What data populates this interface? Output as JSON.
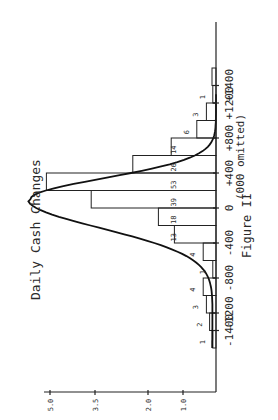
{
  "chart_data": {
    "type": "bar",
    "title": "Daily Cash Changes",
    "caption": "Figure II",
    "xlabel": "(000 omitted)",
    "ylabel": "",
    "orientation_note": "figure printed rotated 90 degrees counter-clockwise",
    "x_tick_labels": [
      "-1400",
      "-1200",
      "-800",
      "-400",
      "0",
      "+400",
      "+800",
      "+1200",
      "+1400"
    ],
    "y_tick_labels": [
      "1.0",
      "2.0",
      "3.5",
      "5.0"
    ],
    "bin_width": 200,
    "bins": [
      {
        "from": -1600,
        "to": -1400,
        "count": 1
      },
      {
        "from": -1400,
        "to": -1200,
        "count": 2
      },
      {
        "from": -1200,
        "to": -1000,
        "count": 3
      },
      {
        "from": -1000,
        "to": -800,
        "count": 4
      },
      {
        "from": -800,
        "to": -600,
        "count": 1
      },
      {
        "from": -600,
        "to": -400,
        "count": 4
      },
      {
        "from": -400,
        "to": -200,
        "count": 13
      },
      {
        "from": -200,
        "to": 0,
        "count": 18
      },
      {
        "from": 0,
        "to": 200,
        "count": 39
      },
      {
        "from": 200,
        "to": 400,
        "count": 53
      },
      {
        "from": 400,
        "to": 600,
        "count": 26
      },
      {
        "from": 600,
        "to": 800,
        "count": 14
      },
      {
        "from": 800,
        "to": 1000,
        "count": 6
      },
      {
        "from": 1000,
        "to": 1200,
        "count": 3
      },
      {
        "from": 1200,
        "to": 1400,
        "count": 1
      },
      {
        "from": 1400,
        "to": 1600,
        "count": 0
      }
    ],
    "categories": [
      "-1600",
      "-1400",
      "-1200",
      "-1000",
      "-800",
      "-600",
      "-400",
      "-200",
      "0",
      "+200",
      "+400",
      "+600",
      "+800",
      "+1000",
      "+1200",
      "+1400"
    ],
    "values": [
      1,
      2,
      3,
      4,
      1,
      4,
      13,
      18,
      39,
      53,
      26,
      14,
      6,
      3,
      1,
      0
    ],
    "overlay": "fitted smooth frequency curve peaking near 0",
    "grid": false,
    "legend": null
  }
}
